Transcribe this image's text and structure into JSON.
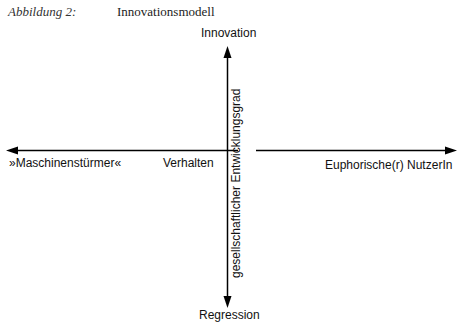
{
  "caption": {
    "label": "Abbildung 2:",
    "title": "Innovationsmodell"
  },
  "diagram": {
    "top_label": "Innovation",
    "bottom_label": "Regression",
    "left_label": "»Maschinenstürmer«",
    "center_left_label": "Verhalten",
    "right_label": "Euphorische(r) NutzerIn",
    "vertical_axis_label": "gesellschaftlicher Entwicklungsgrad",
    "line_color": "#000000"
  }
}
